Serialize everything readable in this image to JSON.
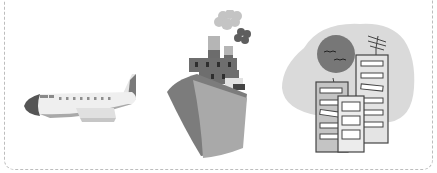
{
  "illustration": {
    "items": [
      {
        "name": "airplane",
        "icon": "airplane-icon"
      },
      {
        "name": "ship",
        "icon": "ship-icon"
      },
      {
        "name": "city",
        "icon": "city-buildings-icon"
      }
    ],
    "colors": {
      "border": "#bdbdbd",
      "light": "#ebebeb",
      "mid": "#a8a8a8",
      "dark": "#555555",
      "blob": "#dcdcdc",
      "sun": "#777777"
    }
  }
}
